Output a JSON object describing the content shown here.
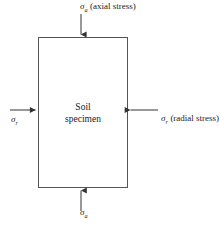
{
  "figure": {
    "background_color": "#ffffff",
    "line_color": "#555555",
    "text_color": "#1a1a1a"
  },
  "specimen": {
    "line1": "Soil",
    "line2": "specimen",
    "box": {
      "x": 38,
      "y": 37,
      "width": 90,
      "height": 151
    }
  },
  "labels": {
    "axial_top": {
      "symbol": "σ",
      "subscript": "a",
      "description": "(axial stress)"
    },
    "axial_bottom": {
      "symbol": "σ",
      "subscript": "a",
      "description": ""
    },
    "radial_right": {
      "symbol": "σ",
      "subscript": "r",
      "description": "(radial stress)"
    },
    "radial_left": {
      "symbol": "σ",
      "subscript": "r",
      "description": ""
    }
  },
  "arrows": [
    {
      "name": "axial-top-arrow",
      "direction": "down",
      "from": [
        81,
        14
      ],
      "to": [
        81,
        37
      ]
    },
    {
      "name": "axial-bottom-arrow",
      "direction": "up",
      "from": [
        81,
        211
      ],
      "to": [
        81,
        188
      ]
    },
    {
      "name": "radial-left-arrow",
      "direction": "right",
      "from": [
        10,
        110
      ],
      "to": [
        38,
        110
      ]
    },
    {
      "name": "radial-right-arrow",
      "direction": "left",
      "from": [
        158,
        110
      ],
      "to": [
        128,
        110
      ]
    }
  ]
}
